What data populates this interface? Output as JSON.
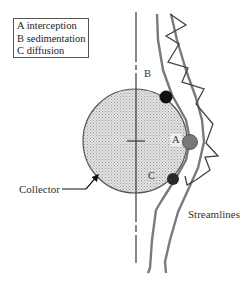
{
  "diagram": {
    "legend": {
      "items": [
        {
          "key": "A",
          "label": "A interception"
        },
        {
          "key": "B",
          "label": "B sedimentation"
        },
        {
          "key": "C",
          "label": "C diffusion"
        }
      ]
    },
    "labels": {
      "a": "A",
      "b": "B",
      "c": "C",
      "collector": "Collector",
      "streamlines": "Streamlines"
    },
    "colors": {
      "collector_fill": "#d4d4d4",
      "collector_edge": "#555555",
      "streamline": "#7a7a7a",
      "zigzag": "#444444",
      "particle_a": "#777777",
      "particle_b": "#111111",
      "particle_c": "#2a2a2a",
      "axis": "#444444"
    }
  }
}
